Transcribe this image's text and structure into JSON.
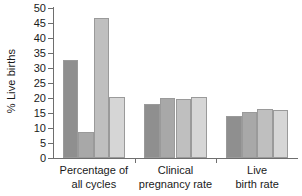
{
  "chart_data": {
    "type": "bar",
    "title": "",
    "subtitle": "",
    "xlabel": "",
    "ylabel": "% Live births",
    "ylim": [
      0,
      50
    ],
    "yticks": [
      0,
      5,
      10,
      15,
      20,
      25,
      30,
      35,
      40,
      45,
      50
    ],
    "ytick_labels": [
      "0",
      "5",
      "10",
      "15",
      "20",
      "25",
      "30",
      "35",
      "40",
      "45",
      "50"
    ],
    "grid": false,
    "legend": "none",
    "categories": [
      "Percentage of all cycles",
      "Clinical pregnancy rate",
      "Live birth rate"
    ],
    "category_lines": [
      [
        "Percentage of",
        "all cycles"
      ],
      [
        "Clinical",
        "pregnancy rate"
      ],
      [
        "Live",
        "birth rate"
      ]
    ],
    "series": [
      {
        "name": "series-1",
        "color": "#8f8f8f",
        "values": [
          32.6,
          17.9,
          14.1
        ]
      },
      {
        "name": "series-2",
        "color": "#a8a8a8",
        "values": [
          8.7,
          20.1,
          15.4
        ]
      },
      {
        "name": "series-3",
        "color": "#bfbfbf",
        "values": [
          46.8,
          19.6,
          16.3
        ]
      },
      {
        "name": "series-4",
        "color": "#d6d6d6",
        "values": [
          20.3,
          20.4,
          15.9
        ]
      }
    ],
    "bar_edge_color": "#9a9a9a",
    "axis_color": "#6e6e6e",
    "text_color": "#1a1a1a",
    "background": "#ffffff"
  }
}
